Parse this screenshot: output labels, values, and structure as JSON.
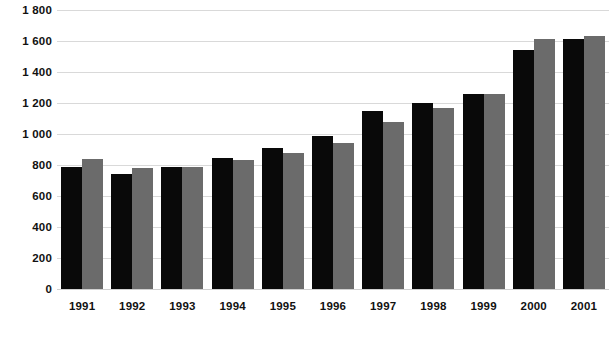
{
  "chart_data": {
    "type": "bar",
    "title": "",
    "subtitle": "",
    "xlabel": "",
    "ylabel": "",
    "categories": [
      "1991",
      "1992",
      "1993",
      "1994",
      "1995",
      "1996",
      "1997",
      "1998",
      "1999",
      "2000",
      "2001"
    ],
    "series": [
      {
        "name": "Series 1",
        "color": "#090909",
        "values": [
          785,
          740,
          790,
          845,
          910,
          990,
          1150,
          1200,
          1255,
          1545,
          1615
        ]
      },
      {
        "name": "Series 2",
        "color": "#6b6b6b",
        "values": [
          840,
          780,
          790,
          830,
          875,
          945,
          1080,
          1165,
          1255,
          1610,
          1635
        ]
      }
    ],
    "ylim": [
      0,
      1800
    ],
    "ytick_values": [
      0,
      200,
      400,
      600,
      800,
      1000,
      1200,
      1400,
      1600,
      1800
    ],
    "ytick_labels": [
      "0",
      "200",
      "400",
      "600",
      "800",
      "1 000",
      "1 200",
      "1 400",
      "1 600",
      "1 800"
    ],
    "grid": true,
    "grid_color": "#d9d9d9",
    "legend": false,
    "legend_position": "none",
    "background_color": "#ffffff",
    "annotations": []
  }
}
